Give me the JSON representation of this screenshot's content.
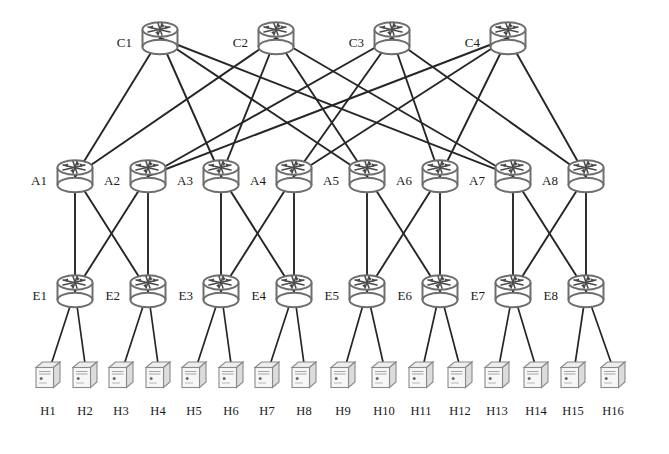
{
  "diagram": {
    "background_color": "#ffffff",
    "link_color": "#262626",
    "device_outline_color": "#6b6b6b",
    "label_color": "#1a1a1a",
    "host_fill_color": "#f2f2f2",
    "host_side_color": "#d9d9d9",
    "layers": [
      {
        "name": "core",
        "label_prefix": "C",
        "count": 4,
        "y": 42
      },
      {
        "name": "aggregation",
        "label_prefix": "A",
        "count": 8,
        "y": 180
      },
      {
        "name": "edge",
        "label_prefix": "E",
        "count": 8,
        "y": 295
      },
      {
        "name": "host",
        "label_prefix": "H",
        "count": 16,
        "y": 393
      }
    ]
  },
  "core_switches": [
    {
      "id": "C1",
      "label": "C1",
      "x": 160,
      "y": 42
    },
    {
      "id": "C2",
      "label": "C2",
      "x": 276,
      "y": 42
    },
    {
      "id": "C3",
      "label": "C3",
      "x": 392,
      "y": 42
    },
    {
      "id": "C4",
      "label": "C4",
      "x": 508,
      "y": 42
    }
  ],
  "aggregation_switches": [
    {
      "id": "A1",
      "label": "A1",
      "x": 75,
      "y": 180
    },
    {
      "id": "A2",
      "label": "A2",
      "x": 148,
      "y": 180
    },
    {
      "id": "A3",
      "label": "A3",
      "x": 221,
      "y": 180
    },
    {
      "id": "A4",
      "label": "A4",
      "x": 294,
      "y": 180
    },
    {
      "id": "A5",
      "label": "A5",
      "x": 367,
      "y": 180
    },
    {
      "id": "A6",
      "label": "A6",
      "x": 440,
      "y": 180
    },
    {
      "id": "A7",
      "label": "A7",
      "x": 513,
      "y": 180
    },
    {
      "id": "A8",
      "label": "A8",
      "x": 586,
      "y": 180
    }
  ],
  "edge_switches": [
    {
      "id": "E1",
      "label": "E1",
      "x": 75,
      "y": 295
    },
    {
      "id": "E2",
      "label": "E2",
      "x": 148,
      "y": 295
    },
    {
      "id": "E3",
      "label": "E3",
      "x": 221,
      "y": 295
    },
    {
      "id": "E4",
      "label": "E4",
      "x": 294,
      "y": 295
    },
    {
      "id": "E5",
      "label": "E5",
      "x": 367,
      "y": 295
    },
    {
      "id": "E6",
      "label": "E6",
      "x": 440,
      "y": 295
    },
    {
      "id": "E7",
      "label": "E7",
      "x": 513,
      "y": 295
    },
    {
      "id": "E8",
      "label": "E8",
      "x": 586,
      "y": 295
    }
  ],
  "hosts": [
    {
      "id": "H1",
      "label": "H1",
      "x": 48,
      "y": 393
    },
    {
      "id": "H2",
      "label": "H2",
      "x": 85,
      "y": 393
    },
    {
      "id": "H3",
      "label": "H3",
      "x": 121,
      "y": 393
    },
    {
      "id": "H4",
      "label": "H4",
      "x": 158,
      "y": 393
    },
    {
      "id": "H5",
      "label": "H5",
      "x": 194,
      "y": 393
    },
    {
      "id": "H6",
      "label": "H6",
      "x": 231,
      "y": 393
    },
    {
      "id": "H7",
      "label": "H7",
      "x": 267,
      "y": 393
    },
    {
      "id": "H8",
      "label": "H8",
      "x": 304,
      "y": 393
    },
    {
      "id": "H9",
      "label": "H9",
      "x": 343,
      "y": 393
    },
    {
      "id": "H10",
      "label": "H10",
      "x": 384,
      "y": 393
    },
    {
      "id": "H11",
      "label": "H11",
      "x": 421,
      "y": 393
    },
    {
      "id": "H12",
      "label": "H12",
      "x": 460,
      "y": 393
    },
    {
      "id": "H13",
      "label": "H13",
      "x": 497,
      "y": 393
    },
    {
      "id": "H14",
      "label": "H14",
      "x": 536,
      "y": 393
    },
    {
      "id": "H15",
      "label": "H15",
      "x": 573,
      "y": 393
    },
    {
      "id": "H16",
      "label": "H16",
      "x": 613,
      "y": 393
    }
  ],
  "links": {
    "core_to_aggregation": [
      [
        "C1",
        "A1"
      ],
      [
        "C1",
        "A3"
      ],
      [
        "C1",
        "A5"
      ],
      [
        "C1",
        "A7"
      ],
      [
        "C2",
        "A1"
      ],
      [
        "C2",
        "A3"
      ],
      [
        "C2",
        "A5"
      ],
      [
        "C2",
        "A7"
      ],
      [
        "C3",
        "A2"
      ],
      [
        "C3",
        "A4"
      ],
      [
        "C3",
        "A6"
      ],
      [
        "C3",
        "A8"
      ],
      [
        "C4",
        "A2"
      ],
      [
        "C4",
        "A4"
      ],
      [
        "C4",
        "A6"
      ],
      [
        "C4",
        "A8"
      ]
    ],
    "aggregation_to_edge": [
      [
        "A1",
        "E1"
      ],
      [
        "A1",
        "E2"
      ],
      [
        "A2",
        "E1"
      ],
      [
        "A2",
        "E2"
      ],
      [
        "A3",
        "E3"
      ],
      [
        "A3",
        "E4"
      ],
      [
        "A4",
        "E3"
      ],
      [
        "A4",
        "E4"
      ],
      [
        "A5",
        "E5"
      ],
      [
        "A5",
        "E6"
      ],
      [
        "A6",
        "E5"
      ],
      [
        "A6",
        "E6"
      ],
      [
        "A7",
        "E7"
      ],
      [
        "A7",
        "E8"
      ],
      [
        "A8",
        "E7"
      ],
      [
        "A8",
        "E8"
      ]
    ],
    "edge_to_host": [
      [
        "E1",
        "H1"
      ],
      [
        "E1",
        "H2"
      ],
      [
        "E2",
        "H3"
      ],
      [
        "E2",
        "H4"
      ],
      [
        "E3",
        "H5"
      ],
      [
        "E3",
        "H6"
      ],
      [
        "E4",
        "H7"
      ],
      [
        "E4",
        "H8"
      ],
      [
        "E5",
        "H9"
      ],
      [
        "E5",
        "H10"
      ],
      [
        "E6",
        "H11"
      ],
      [
        "E6",
        "H12"
      ],
      [
        "E7",
        "H13"
      ],
      [
        "E7",
        "H14"
      ],
      [
        "E8",
        "H15"
      ],
      [
        "E8",
        "H16"
      ]
    ]
  },
  "counts": {
    "core": 4,
    "aggregation": 8,
    "edge": 8,
    "hosts": 16,
    "core_aggregation_links": 16,
    "aggregation_edge_links": 16,
    "edge_host_links": 16
  }
}
